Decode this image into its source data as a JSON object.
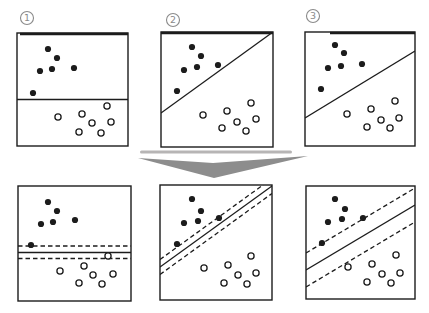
{
  "figure": {
    "canvas": {
      "width": 429,
      "height": 313,
      "background": "#ffffff"
    },
    "ink_color": "#1c1c1c",
    "label_color": "#8a8a8a",
    "dot_radius": 3.1,
    "arrow": {
      "color": "#8d8d8d",
      "points": [
        [
          138,
          158
        ],
        [
          213,
          163
        ],
        [
          308,
          156
        ],
        [
          214,
          178
        ]
      ]
    },
    "panel_labels": [
      {
        "number": "1",
        "cx": 27,
        "cy": 18
      },
      {
        "number": "2",
        "cx": 173,
        "cy": 20
      },
      {
        "number": "3",
        "cx": 313,
        "cy": 16
      }
    ],
    "artifacts": [
      {
        "x": 140,
        "y": 150.5,
        "width": 152,
        "height": 3,
        "color": "#b7b5b5"
      }
    ],
    "panels": [
      {
        "id": "panel-1-top-left",
        "box": [
          17,
          33,
          111,
          113
        ],
        "extra_strokes": [
          {
            "x1": 20,
            "y1": 34,
            "x2": 128,
            "y2": 34,
            "width": 2.4
          }
        ],
        "lines": [
          {
            "style": "solid",
            "x1": 17,
            "y1": 99.5,
            "x2": 128,
            "y2": 99.5
          }
        ],
        "black_dots": [
          [
            48,
            49
          ],
          [
            57,
            58
          ],
          [
            40,
            71
          ],
          [
            52,
            69
          ],
          [
            74,
            68
          ],
          [
            33,
            93
          ]
        ],
        "white_dots": [
          [
            107,
            106
          ],
          [
            58,
            117
          ],
          [
            82,
            114
          ],
          [
            92,
            123
          ],
          [
            111,
            122
          ],
          [
            79,
            132
          ],
          [
            101,
            133
          ]
        ]
      },
      {
        "id": "panel-2-top-middle",
        "box": [
          161,
          32,
          112,
          115
        ],
        "extra_strokes": [
          {
            "x1": 161,
            "y1": 33,
            "x2": 273,
            "y2": 33,
            "width": 2.4
          }
        ],
        "lines": [
          {
            "style": "solid",
            "x1": 161,
            "y1": 113,
            "x2": 273,
            "y2": 32
          }
        ],
        "black_dots": [
          [
            192,
            47
          ],
          [
            201,
            56
          ],
          [
            184,
            70
          ],
          [
            197,
            67
          ],
          [
            218,
            65
          ],
          [
            177,
            91
          ]
        ],
        "white_dots": [
          [
            251,
            103
          ],
          [
            227,
            111
          ],
          [
            203,
            115
          ],
          [
            256,
            119
          ],
          [
            237,
            122
          ],
          [
            222,
            128
          ],
          [
            246,
            131
          ]
        ]
      },
      {
        "id": "panel-3-top-right",
        "box": [
          305,
          32,
          110,
          114
        ],
        "extra_strokes": [
          {
            "x1": 330,
            "y1": 33,
            "x2": 415,
            "y2": 33,
            "width": 2.4
          }
        ],
        "lines": [
          {
            "style": "solid",
            "x1": 305,
            "y1": 118,
            "x2": 415,
            "y2": 51
          }
        ],
        "black_dots": [
          [
            335,
            45
          ],
          [
            344,
            53
          ],
          [
            328,
            68
          ],
          [
            341,
            66
          ],
          [
            362,
            64
          ],
          [
            321,
            89
          ]
        ],
        "white_dots": [
          [
            395,
            101
          ],
          [
            371,
            109
          ],
          [
            347,
            114
          ],
          [
            399,
            118
          ],
          [
            381,
            120
          ],
          [
            367,
            127
          ],
          [
            390,
            128
          ]
        ]
      },
      {
        "id": "panel-4-bottom-left",
        "box": [
          18,
          186,
          113,
          115
        ],
        "extra_strokes": [],
        "lines": [
          {
            "style": "dashed",
            "x1": 18,
            "y1": 246,
            "x2": 131,
            "y2": 246
          },
          {
            "style": "solid",
            "x1": 18,
            "y1": 252.5,
            "x2": 131,
            "y2": 252.5
          },
          {
            "style": "dashed",
            "x1": 18,
            "y1": 258.5,
            "x2": 131,
            "y2": 258.5
          }
        ],
        "black_dots": [
          [
            48,
            202
          ],
          [
            57,
            211
          ],
          [
            41,
            224
          ],
          [
            53,
            222
          ],
          [
            75,
            220
          ],
          [
            31,
            245
          ]
        ],
        "white_dots": [
          [
            108,
            256
          ],
          [
            84,
            266
          ],
          [
            60,
            271
          ],
          [
            93,
            275
          ],
          [
            113,
            274
          ],
          [
            79,
            283
          ],
          [
            102,
            284
          ]
        ]
      },
      {
        "id": "panel-5-bottom-middle",
        "box": [
          160,
          185,
          112,
          115
        ],
        "extra_strokes": [],
        "lines": [
          {
            "style": "dashed",
            "x1": 160,
            "y1": 259.5,
            "x2": 272,
            "y2": 178.5
          },
          {
            "style": "solid",
            "x1": 160,
            "y1": 267,
            "x2": 272,
            "y2": 186
          },
          {
            "style": "dashed",
            "x1": 160,
            "y1": 274.5,
            "x2": 272,
            "y2": 193.5
          }
        ],
        "black_dots": [
          [
            192,
            199
          ],
          [
            201,
            211
          ],
          [
            184,
            223
          ],
          [
            198,
            221
          ],
          [
            219,
            218
          ],
          [
            177,
            244
          ]
        ],
        "white_dots": [
          [
            251,
            256
          ],
          [
            228,
            265
          ],
          [
            204,
            268
          ],
          [
            256,
            273
          ],
          [
            238,
            275
          ],
          [
            224,
            283
          ],
          [
            247,
            284
          ]
        ]
      },
      {
        "id": "panel-6-bottom-right",
        "box": [
          306,
          186,
          109,
          113
        ],
        "extra_strokes": [],
        "lines": [
          {
            "style": "dashed",
            "x1": 306,
            "y1": 253,
            "x2": 415,
            "y2": 188
          },
          {
            "style": "solid",
            "x1": 306,
            "y1": 270,
            "x2": 415,
            "y2": 205
          },
          {
            "style": "dashed",
            "x1": 306,
            "y1": 287,
            "x2": 415,
            "y2": 222
          }
        ],
        "black_dots": [
          [
            335,
            199
          ],
          [
            345,
            209
          ],
          [
            328,
            222
          ],
          [
            342,
            219
          ],
          [
            363,
            218
          ],
          [
            322,
            243
          ]
        ],
        "white_dots": [
          [
            396,
            255
          ],
          [
            372,
            264
          ],
          [
            348,
            267
          ],
          [
            400,
            273
          ],
          [
            382,
            274
          ],
          [
            367,
            282
          ],
          [
            391,
            283
          ]
        ]
      }
    ]
  }
}
